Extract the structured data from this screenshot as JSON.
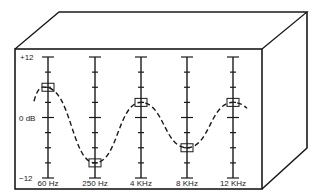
{
  "diagram": {
    "scale": {
      "top_label": "+12",
      "mid_label": "0 dB",
      "bottom_label": "−12"
    },
    "bands": [
      {
        "label": "60 Hz",
        "gain_db": 6
      },
      {
        "label": "250 Hz",
        "gain_db": -9
      },
      {
        "label": "4 KHz",
        "gain_db": 3
      },
      {
        "label": "8 KHz",
        "gain_db": -6
      },
      {
        "label": "12 KHz",
        "gain_db": 3
      }
    ],
    "curve_style": "dashed",
    "colors": {
      "line": "#1a1a1a",
      "background": "#ffffff"
    }
  }
}
